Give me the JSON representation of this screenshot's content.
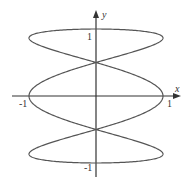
{
  "chart_data": {
    "type": "line",
    "title": "",
    "xlabel": "x",
    "ylabel": "y",
    "xlim": [
      -1.2,
      1.2
    ],
    "ylim": [
      -1.2,
      1.2
    ],
    "x_ticks": [
      "-1",
      "1"
    ],
    "y_ticks": [
      "1",
      "-1"
    ],
    "grid": false,
    "legend": null,
    "series": [
      {
        "name": "curve",
        "param": "t",
        "x_expr": "sin(3t)",
        "y_expr": "cos(t)",
        "t_range": [
          0,
          6.2832
        ],
        "color": "#555555"
      }
    ],
    "key_points": [
      {
        "x": 0,
        "y": 1
      },
      {
        "x": 0,
        "y": 0.5
      },
      {
        "x": 1,
        "y": 0
      },
      {
        "x": -1,
        "y": 0
      },
      {
        "x": 0,
        "y": -0.5
      },
      {
        "x": 0,
        "y": -1
      }
    ]
  },
  "labels": {
    "x_axis": "x",
    "y_axis": "y",
    "x_tick_neg": "-1",
    "x_tick_pos": "1",
    "y_tick_pos": "1",
    "y_tick_neg": "-1"
  },
  "colors": {
    "axis": "#333333",
    "curve": "#555555"
  }
}
